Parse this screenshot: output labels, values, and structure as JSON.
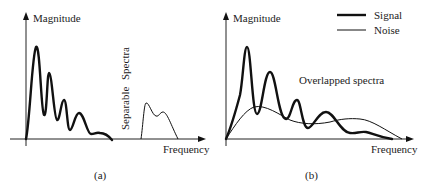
{
  "panels": [
    {
      "id": "a",
      "caption": "(a)",
      "y_axis_label": "Magnitude",
      "x_axis_label": "Frequency",
      "annotation_line1": "Separable",
      "annotation_line2": "Spectra",
      "curves": [
        {
          "name": "Signal",
          "style": "thick"
        },
        {
          "name": "Noise",
          "style": "thin"
        }
      ]
    },
    {
      "id": "b",
      "caption": "(b)",
      "y_axis_label": "Magnitude",
      "x_axis_label": "Frequency",
      "annotation": "Overlapped spectra",
      "legend": [
        {
          "label": "Signal",
          "style": "thick"
        },
        {
          "label": "Noise",
          "style": "thin"
        }
      ]
    }
  ],
  "colors": {
    "line": "#111111",
    "text": "#222222",
    "background": "#ffffff"
  }
}
